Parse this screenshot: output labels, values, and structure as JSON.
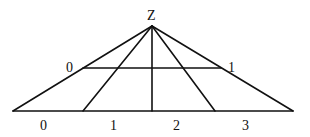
{
  "diagram": {
    "apex_label": "Z",
    "upper_line_labels": [
      "0",
      "1"
    ],
    "base_labels": [
      "0",
      "1",
      "2",
      "3"
    ],
    "line_color": "#111111",
    "background": "#ffffff"
  }
}
